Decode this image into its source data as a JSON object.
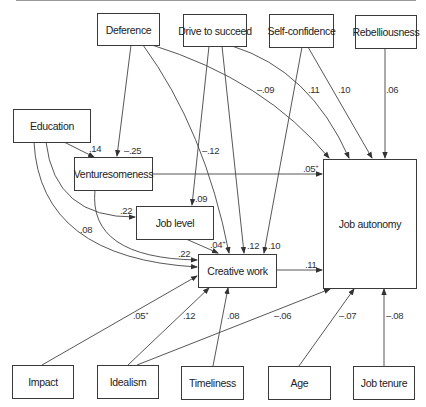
{
  "diagram": {
    "type": "path-diagram",
    "nodes": {
      "deference": "Deference",
      "drive_to_succeed": "Drive to succeed",
      "self_confidence": "Self-confidence",
      "rebelliousness": "Rebelliousness",
      "education": "Education",
      "venturesomeness": "Venturesomeness",
      "job_level": "Job level",
      "creative_work": "Creative work",
      "job_autonomy": "Job autonomy",
      "impact": "Impact",
      "idealism": "Idealism",
      "timeliness": "Timeliness",
      "age": "Age",
      "job_tenure": "Job tenure"
    },
    "edges": [
      {
        "from": "Education",
        "to": "Venturesomeness",
        "coef": ".14"
      },
      {
        "from": "Deference",
        "to": "Venturesomeness",
        "coef": "–.25"
      },
      {
        "from": "Deference",
        "to": "Creative work",
        "coef": "–.12"
      },
      {
        "from": "Deference",
        "to": "Job autonomy",
        "coef": "–.09"
      },
      {
        "from": "Drive to succeed",
        "to": "Job level",
        "coef": ".09"
      },
      {
        "from": "Drive to succeed",
        "to": "Creative work",
        "coef": ".12"
      },
      {
        "from": "Drive to succeed",
        "to": "Job autonomy",
        "coef": ".11"
      },
      {
        "from": "Self-confidence",
        "to": "Creative work",
        "coef": ".10"
      },
      {
        "from": "Self-confidence",
        "to": "Job autonomy",
        "coef": ".10"
      },
      {
        "from": "Rebelliousness",
        "to": "Job autonomy",
        "coef": ".06"
      },
      {
        "from": "Education",
        "to": "Job level",
        "coef": ".22"
      },
      {
        "from": "Education",
        "to": "Creative work",
        "coef": ".08"
      },
      {
        "from": "Venturesomeness",
        "to": "Creative work",
        "coef": ".22"
      },
      {
        "from": "Venturesomeness",
        "to": "Job autonomy",
        "coef": ".05+"
      },
      {
        "from": "Job level",
        "to": "Creative work",
        "coef": ".04+"
      },
      {
        "from": "Creative work",
        "to": "Job autonomy",
        "coef": ".11"
      },
      {
        "from": "Impact",
        "to": "Creative work",
        "coef": ".05+"
      },
      {
        "from": "Idealism",
        "to": "Creative work",
        "coef": ".12"
      },
      {
        "from": "Idealism",
        "to": "Job autonomy",
        "coef": "–.06"
      },
      {
        "from": "Timeliness",
        "to": "Creative work",
        "coef": ".08"
      },
      {
        "from": "Age",
        "to": "Job autonomy",
        "coef": "–.07"
      },
      {
        "from": "Job tenure",
        "to": "Job autonomy",
        "coef": "–.08"
      }
    ],
    "labels": {
      "edu_vent": ".14",
      "def_vent": "–.25",
      "def_cw": "–.12",
      "def_ja": "–.09",
      "dts_jl": ".09",
      "dts_cw": ".12",
      "dts_ja": ".11",
      "sc_cw": ".10",
      "sc_ja": ".10",
      "reb_ja": ".06",
      "edu_jl": ".22",
      "edu_cw": ".08",
      "vent_cw": ".22",
      "vent_ja": ".05",
      "vent_ja_sup": "+",
      "jl_cw": ".04",
      "jl_cw_sup": "+",
      "cw_ja": ".11",
      "imp_cw": ".05",
      "imp_cw_sup": "+",
      "ideal_cw": ".12",
      "ideal_ja": "–.06",
      "time_cw": ".08",
      "age_ja": "–.07",
      "tenure_ja": "–.08"
    }
  }
}
